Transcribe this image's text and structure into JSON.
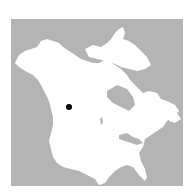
{
  "map": {
    "region": "North America",
    "colors": {
      "water": "#b4b4b4",
      "land": "#ffffff",
      "marker": "#000000"
    },
    "marker": {
      "label": "",
      "x": 58,
      "y": 88,
      "radius": 3
    }
  }
}
